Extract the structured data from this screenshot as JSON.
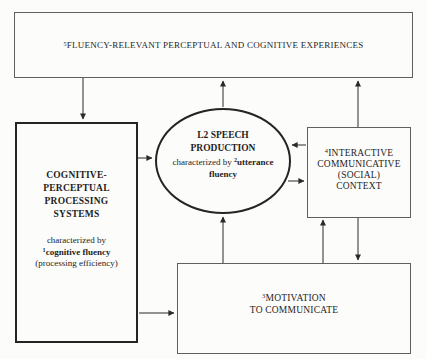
{
  "top_box": {
    "sup": "5",
    "label": "FLUENCY-RELEVANT PERCEPTUAL AND COGNITIVE EXPERIENCES"
  },
  "left_box": {
    "title_lines": [
      "COGNITIVE-",
      "PERCEPTUAL",
      "PROCESSING",
      "SYSTEMS"
    ],
    "characterized_by": "characterized by",
    "sup": "1",
    "fluency_term": "cognitive fluency",
    "note": "(processing efficiency)"
  },
  "ellipse": {
    "title_lines": [
      "L2 SPEECH",
      "PRODUCTION"
    ],
    "characterized_by": "characterized by",
    "sup": "2",
    "fluency_term_word1": "utterance",
    "fluency_term_word2": "fluency"
  },
  "right_box": {
    "sup": "4",
    "lines": [
      "INTERACTIVE",
      "COMMUNICATIVE",
      "(SOCIAL)",
      "CONTEXT"
    ]
  },
  "bottom_box": {
    "sup": "3",
    "lines": [
      "MOTIVATION",
      "TO COMMUNICATE"
    ]
  },
  "connections": [
    {
      "from": "fluency-experiences",
      "to": "cognitive-perceptual-systems",
      "direction": "down"
    },
    {
      "from": "l2-speech-production",
      "to": "fluency-experiences",
      "direction": "up"
    },
    {
      "from": "interactive-communicative-context",
      "to": "fluency-experiences",
      "direction": "up"
    },
    {
      "from": "cognitive-perceptual-systems",
      "to": "l2-speech-production",
      "direction": "right"
    },
    {
      "from": "interactive-communicative-context",
      "to": "l2-speech-production",
      "direction": "left"
    },
    {
      "from": "l2-speech-production",
      "to": "interactive-communicative-context",
      "direction": "right"
    },
    {
      "from": "motivation-to-communicate",
      "to": "l2-speech-production",
      "direction": "up"
    },
    {
      "from": "cognitive-perceptual-systems",
      "to": "motivation-to-communicate",
      "direction": "right"
    },
    {
      "from": "motivation-to-communicate",
      "to": "interactive-communicative-context",
      "direction": "up"
    },
    {
      "from": "interactive-communicative-context",
      "to": "motivation-to-communicate",
      "direction": "down"
    }
  ],
  "colors": {
    "background": "#fcfcfa",
    "border_strong": "#242424",
    "border_light": "#5f5f5f",
    "arrow": "#2a2a2a",
    "text": "#1e1e1e"
  }
}
